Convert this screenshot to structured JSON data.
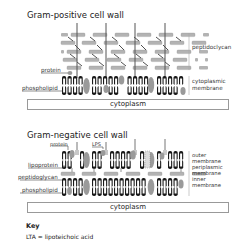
{
  "gram_positive": {
    "title": "Gram-positive cell wall",
    "labels": {
      "peptidoglycan": "peptidoclycan",
      "protein": "protein",
      "phospholipid": "phospholipid",
      "membrane_line1": "cytoplasmic",
      "membrane_line2": "membrane",
      "cytoplasm": "cytoplasm"
    }
  },
  "gram_negative": {
    "title": "Gram-negative cell wall",
    "labels": {
      "protein": "protein",
      "lps": "LPS",
      "lipoprotein": "lipoprotein",
      "peptidoglycan": "peptidoglycan",
      "phospholipid": "phospholipid",
      "outer_membrane_line1": "outer",
      "outer_membrane_line2": "membrane",
      "periplasmic_line1": "periplasmic",
      "periplasmic_line2": "membrane",
      "inner_membrane_line1": "inner",
      "inner_membrane_line2": "membrane",
      "cytoplasm": "cytoplasm"
    }
  },
  "key": {
    "title": "Key",
    "entries": [
      "LTA = lipoteichoic acid"
    ]
  },
  "colors": {
    "peptidoglycan_fill": "#b3b3b3",
    "protein_fill": "#9a9a9a",
    "lipid_head": "#1a1a1a",
    "text": "#222222"
  }
}
